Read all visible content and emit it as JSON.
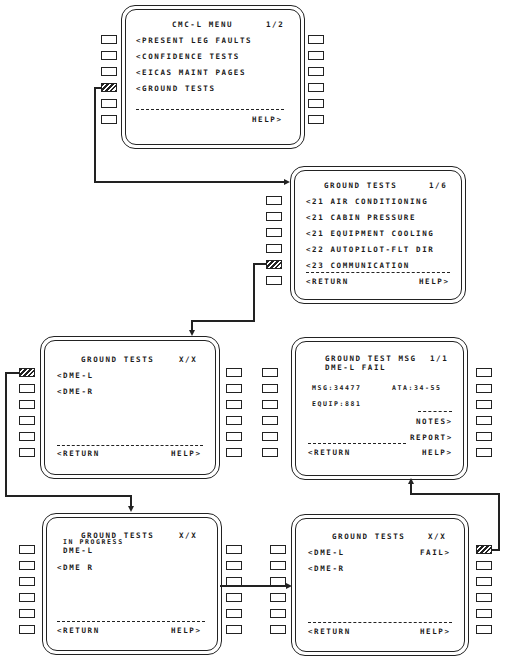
{
  "screens": {
    "cmc_menu": {
      "title": "CMC-L MENU",
      "page": "1/2",
      "items": [
        "<PRESENT LEG FAULTS",
        "<CONFIDENCE TESTS",
        "<EICAS MAINT PAGES",
        "<GROUND TESTS"
      ],
      "help": "HELP>"
    },
    "ground_tests_index": {
      "title": "GROUND TESTS",
      "page": "1/6",
      "items": [
        "<21 AIR CONDITIONING",
        "<21 CABIN PRESSURE",
        "<21 EQUIPMENT COOLING",
        "<22 AUTOPILOT-FLT DIR",
        "<23 COMMUNICATION"
      ],
      "return": "<RETURN",
      "help": "HELP>"
    },
    "ground_tests_dme": {
      "title": "GROUND TESTS",
      "page": "X/X",
      "items": [
        "<DME-L",
        "<DME-R"
      ],
      "return": "<RETURN",
      "help": "HELP>"
    },
    "ground_test_msg": {
      "title": "GROUND TEST MSG",
      "page": "1/1",
      "subtitle": "DME-L FAIL",
      "msg": "MSG:34477",
      "ata": "ATA:34-55",
      "equip": "EQUIP:881",
      "notes": "NOTES>",
      "report": "REPORT>",
      "return": "<RETURN",
      "help": "HELP>"
    },
    "ground_tests_in_progress": {
      "title": "GROUND TESTS",
      "page": "X/X",
      "status": "IN PROGRESS",
      "status_item": "DME-L",
      "items": [
        "<DME R"
      ],
      "return": "<RETURN",
      "help": "HELP>"
    },
    "ground_tests_result": {
      "title": "GROUND TESTS",
      "page": "X/X",
      "items": [
        "<DME-L",
        "<DME-R"
      ],
      "result": "FAIL>",
      "return": "<RETURN",
      "help": "HELP>"
    }
  }
}
